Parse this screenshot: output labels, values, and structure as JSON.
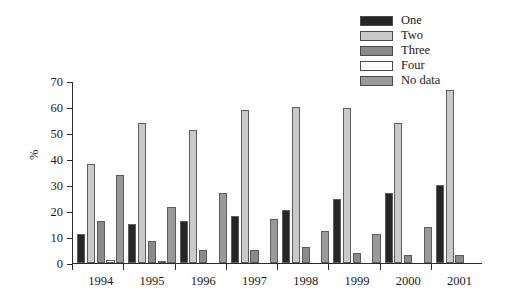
{
  "chart_data": {
    "type": "bar",
    "title": "",
    "xlabel": "",
    "ylabel": "%",
    "ylim": [
      0,
      70
    ],
    "ytick_step": 10,
    "yticks": [
      0,
      10,
      20,
      30,
      40,
      50,
      60,
      70
    ],
    "grid": false,
    "legend_position": "top-right",
    "categories": [
      "1994",
      "1995",
      "1996",
      "1997",
      "1998",
      "1999",
      "2000",
      "2001"
    ],
    "series": [
      {
        "name": "One",
        "color": "#262626",
        "values": [
          11,
          15,
          16,
          18,
          20.5,
          24.5,
          27,
          30
        ]
      },
      {
        "name": "Two",
        "color": "#c9c9c9",
        "values": [
          38,
          54,
          51,
          59,
          60,
          59.5,
          54,
          66.5
        ]
      },
      {
        "name": "Three",
        "color": "#8a8a8a",
        "values": [
          16,
          8.5,
          5,
          5,
          6,
          4,
          3.2,
          3
        ]
      },
      {
        "name": "Four",
        "color": "#ffffff",
        "values": [
          1,
          0.4,
          0,
          0,
          0,
          0,
          0,
          0
        ]
      },
      {
        "name": "No data",
        "color": "#9a9a9a",
        "values": [
          34,
          21.5,
          27,
          17,
          12.5,
          11,
          14,
          0
        ]
      }
    ]
  },
  "legend": {
    "items": [
      {
        "label": "One"
      },
      {
        "label": "Two"
      },
      {
        "label": "Three"
      },
      {
        "label": "Four"
      },
      {
        "label": "No data"
      }
    ]
  }
}
